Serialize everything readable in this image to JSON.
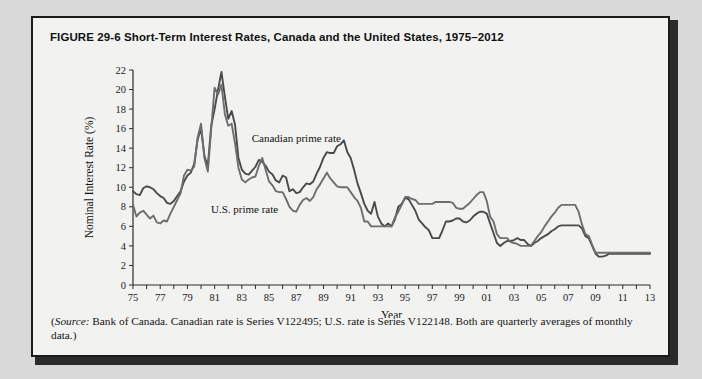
{
  "figure": {
    "label": "FIGURE 29-6",
    "title": "Short-Term Interest Rates, Canada and the United States, 1975–2012",
    "source_prefix": "Source:",
    "source_text": "(Source: Bank of Canada. Canadian rate is Series V122495; U.S. rate is Series V122148. Both are quarterly averages of monthly data.)",
    "source_body": " Bank of Canada. Canadian rate is Series V122495; U.S. rate is Series V122148. Both are quarterly averages of monthly data.)"
  },
  "chart_data": {
    "type": "line",
    "title": "Short-Term Interest Rates, Canada and the United States, 1975–2012",
    "xlabel": "Year",
    "ylabel": "Nominal Interest Rate (%)",
    "xlim": [
      1975,
      2013
    ],
    "ylim": [
      0,
      22
    ],
    "ytick_step": 2,
    "yticks": [
      0,
      2,
      4,
      6,
      8,
      10,
      12,
      14,
      16,
      18,
      20,
      22
    ],
    "xticks_labeled": [
      "75",
      "77",
      "79",
      "81",
      "83",
      "85",
      "87",
      "89",
      "91",
      "93",
      "95",
      "97",
      "99",
      "01",
      "03",
      "05",
      "07",
      "09",
      "11",
      "13"
    ],
    "xtick_every": 1,
    "grid": false,
    "legend_position": "inline-annotation",
    "annotations": [
      {
        "text": "Canadian prime rate",
        "x": 1987.0,
        "y": 14.6
      },
      {
        "text": "U.S. prime rate",
        "x": 1983.2,
        "y": 7.4
      }
    ],
    "colors": {
      "canada": "#4a4a4a",
      "usa": "#6e6e6e"
    },
    "x": [
      1975.0,
      1975.25,
      1975.5,
      1975.75,
      1976.0,
      1976.25,
      1976.5,
      1976.75,
      1977.0,
      1977.25,
      1977.5,
      1977.75,
      1978.0,
      1978.25,
      1978.5,
      1978.75,
      1979.0,
      1979.25,
      1979.5,
      1979.75,
      1980.0,
      1980.25,
      1980.5,
      1980.75,
      1981.0,
      1981.25,
      1981.5,
      1981.75,
      1982.0,
      1982.25,
      1982.5,
      1982.75,
      1983.0,
      1983.25,
      1983.5,
      1983.75,
      1984.0,
      1984.25,
      1984.5,
      1984.75,
      1985.0,
      1985.25,
      1985.5,
      1985.75,
      1986.0,
      1986.25,
      1986.5,
      1986.75,
      1987.0,
      1987.25,
      1987.5,
      1987.75,
      1988.0,
      1988.25,
      1988.5,
      1988.75,
      1989.0,
      1989.25,
      1989.5,
      1989.75,
      1990.0,
      1990.25,
      1990.5,
      1990.75,
      1991.0,
      1991.25,
      1991.5,
      1991.75,
      1992.0,
      1992.25,
      1992.5,
      1992.75,
      1993.0,
      1993.25,
      1993.5,
      1993.75,
      1994.0,
      1994.25,
      1994.5,
      1994.75,
      1995.0,
      1995.25,
      1995.5,
      1995.75,
      1996.0,
      1996.25,
      1996.5,
      1996.75,
      1997.0,
      1997.25,
      1997.5,
      1997.75,
      1998.0,
      1998.25,
      1998.5,
      1998.75,
      1999.0,
      1999.25,
      1999.5,
      1999.75,
      2000.0,
      2000.25,
      2000.5,
      2000.75,
      2001.0,
      2001.25,
      2001.5,
      2001.75,
      2002.0,
      2002.25,
      2002.5,
      2002.75,
      2003.0,
      2003.25,
      2003.5,
      2003.75,
      2004.0,
      2004.25,
      2004.5,
      2004.75,
      2005.0,
      2005.25,
      2005.5,
      2005.75,
      2006.0,
      2006.25,
      2006.5,
      2006.75,
      2007.0,
      2007.25,
      2007.5,
      2007.75,
      2008.0,
      2008.25,
      2008.5,
      2008.75,
      2009.0,
      2009.25,
      2009.5,
      2009.75,
      2010.0,
      2010.25,
      2010.5,
      2010.75,
      2011.0,
      2011.25,
      2011.5,
      2011.75,
      2012.0,
      2012.25,
      2012.5,
      2012.75,
      2013.0
    ],
    "series": [
      {
        "name": "Canadian prime rate",
        "values": [
          9.6,
          9.3,
          9.2,
          9.9,
          10.1,
          10.0,
          9.8,
          9.4,
          9.1,
          8.9,
          8.4,
          8.3,
          8.6,
          9.1,
          9.6,
          10.6,
          11.2,
          11.5,
          12.4,
          14.9,
          16.0,
          13.2,
          12.2,
          16.3,
          18.0,
          20.0,
          21.8,
          19.3,
          17.0,
          17.8,
          16.4,
          13.0,
          11.8,
          11.4,
          11.3,
          11.7,
          12.1,
          12.8,
          12.6,
          12.2,
          11.6,
          11.3,
          10.7,
          10.5,
          11.2,
          11.0,
          9.6,
          9.8,
          9.4,
          9.5,
          10.0,
          10.4,
          10.3,
          10.6,
          11.4,
          12.1,
          13.0,
          13.6,
          13.5,
          13.5,
          14.2,
          14.4,
          14.8,
          13.6,
          13.0,
          11.8,
          10.4,
          9.4,
          8.3,
          7.6,
          7.3,
          8.5,
          7.0,
          6.3,
          6.0,
          6.3,
          6.0,
          6.7,
          8.0,
          8.3,
          8.9,
          8.8,
          8.2,
          7.6,
          6.7,
          6.3,
          5.9,
          5.6,
          4.8,
          4.8,
          4.8,
          5.6,
          6.5,
          6.5,
          6.6,
          6.8,
          6.8,
          6.5,
          6.4,
          6.6,
          7.0,
          7.3,
          7.5,
          7.5,
          7.3,
          6.3,
          5.3,
          4.3,
          4.0,
          4.3,
          4.5,
          4.5,
          4.6,
          4.8,
          4.6,
          4.6,
          4.2,
          4.0,
          4.3,
          4.5,
          4.8,
          5.0,
          5.2,
          5.5,
          5.7,
          6.0,
          6.1,
          6.1,
          6.1,
          6.1,
          6.1,
          6.1,
          5.8,
          5.0,
          4.8,
          4.0,
          3.2,
          2.9,
          2.9,
          3.0,
          3.2,
          3.2,
          3.2,
          3.2,
          3.2,
          3.2,
          3.2,
          3.2,
          3.2,
          3.2,
          3.2,
          3.2,
          3.2
        ]
      },
      {
        "name": "U.S. prime rate",
        "values": [
          8.2,
          7.0,
          7.4,
          7.6,
          7.2,
          6.8,
          7.1,
          6.4,
          6.3,
          6.6,
          6.5,
          7.3,
          8.0,
          8.7,
          9.4,
          11.2,
          11.8,
          11.7,
          12.1,
          15.1,
          16.5,
          13.0,
          11.6,
          16.0,
          20.2,
          19.5,
          20.5,
          17.5,
          16.3,
          16.5,
          14.5,
          12.0,
          10.8,
          10.5,
          10.8,
          11.0,
          11.1,
          12.2,
          13.0,
          11.8,
          10.6,
          10.2,
          9.6,
          9.5,
          9.5,
          8.8,
          8.0,
          7.6,
          7.5,
          8.2,
          8.7,
          8.9,
          8.6,
          9.0,
          9.8,
          10.3,
          10.9,
          11.5,
          10.9,
          10.5,
          10.1,
          10.0,
          10.0,
          10.0,
          9.5,
          9.0,
          8.6,
          7.9,
          6.5,
          6.5,
          6.0,
          6.0,
          6.0,
          6.0,
          6.0,
          6.0,
          6.0,
          6.9,
          7.5,
          8.2,
          9.0,
          9.0,
          8.8,
          8.7,
          8.3,
          8.3,
          8.3,
          8.3,
          8.3,
          8.5,
          8.5,
          8.5,
          8.5,
          8.5,
          8.4,
          7.9,
          7.8,
          7.8,
          8.1,
          8.4,
          8.8,
          9.2,
          9.5,
          9.5,
          8.6,
          7.0,
          6.5,
          5.2,
          4.8,
          4.8,
          4.8,
          4.4,
          4.3,
          4.2,
          4.0,
          4.0,
          4.0,
          4.0,
          4.5,
          5.0,
          5.4,
          6.0,
          6.5,
          7.0,
          7.4,
          7.9,
          8.2,
          8.2,
          8.2,
          8.2,
          8.2,
          7.5,
          6.2,
          5.2,
          5.0,
          4.1,
          3.3,
          3.3,
          3.3,
          3.3,
          3.3,
          3.3,
          3.3,
          3.3,
          3.3,
          3.3,
          3.3,
          3.3,
          3.3,
          3.3,
          3.3,
          3.3,
          3.3
        ]
      }
    ]
  }
}
